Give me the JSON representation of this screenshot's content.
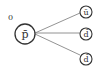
{
  "diagram": {
    "parent": {
      "label": "p̄",
      "charge_label": "0"
    },
    "children": [
      {
        "label": "ū"
      },
      {
        "label": "d̄"
      },
      {
        "label": "d̄"
      }
    ],
    "stroke_color": "#333333",
    "line_color": "#666666"
  }
}
